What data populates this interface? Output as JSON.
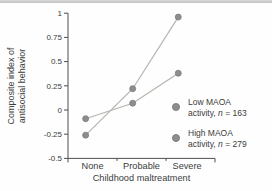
{
  "chart_data": {
    "type": "line",
    "title": "",
    "xlabel": "Childhood maltreatment",
    "ylabel": "Composite index of antisocial behavior",
    "ylabel_line1": "Composite index of",
    "ylabel_line2": "antisocial behavior",
    "categories": [
      "None",
      "Probable",
      "Severe"
    ],
    "series": [
      {
        "name": "Low MAOA activity, n = 163",
        "legend_line1": "Low MAOA",
        "legend_pre": "activity, ",
        "legend_n": "n",
        "legend_post": " = 163",
        "n": 163,
        "values": [
          -0.26,
          0.22,
          0.96
        ]
      },
      {
        "name": "High MAOA activity, n = 279",
        "legend_line1": "High MAOA",
        "legend_pre": "activity, ",
        "legend_n": "n",
        "legend_post": " = 279",
        "n": 279,
        "values": [
          -0.09,
          0.07,
          0.38
        ]
      }
    ],
    "ylim": [
      -0.5,
      1
    ],
    "yticks": [
      1,
      0.75,
      0.5,
      0.25,
      0,
      -0.25,
      -0.5
    ],
    "ytick_labels": [
      "1",
      "0.75",
      "0.5",
      "0.25",
      "0",
      "-0.25",
      "-0.5"
    ],
    "grid": false,
    "legend_position": "right",
    "marker": "circle",
    "colors": {
      "line": "#b7b4ad",
      "marker": "#8d8d8d",
      "marker_edge": "#7e7e7e",
      "axis": "#4f4f4f",
      "text": "#3c3c3c",
      "top_rule": "#c6c6c6",
      "background": "#fefefe"
    }
  }
}
